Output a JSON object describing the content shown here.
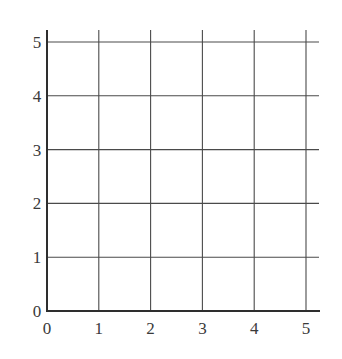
{
  "chart_data": {
    "type": "grid",
    "title": "",
    "xlabel": "",
    "ylabel": "",
    "xlim": [
      0,
      5
    ],
    "ylim": [
      0,
      5
    ],
    "x_ticks": [
      "0",
      "1",
      "2",
      "3",
      "4",
      "5"
    ],
    "y_ticks": [
      "0",
      "1",
      "2",
      "3",
      "4",
      "5"
    ],
    "grid": true,
    "series": []
  },
  "colors": {
    "axis": "#2e2e2e",
    "grid": "#4a4a4a",
    "label": "#3a3a3a",
    "background": "#ffffff"
  }
}
